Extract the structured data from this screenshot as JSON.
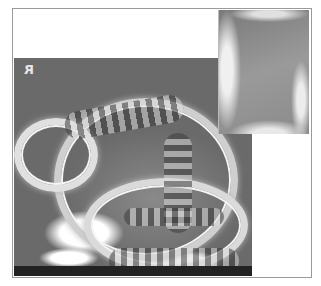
{
  "figure": {
    "main_image": {
      "label": "Main radiograph",
      "orientation_marker": "R"
    },
    "inset_image": {
      "label": "Inset magnified view"
    }
  }
}
